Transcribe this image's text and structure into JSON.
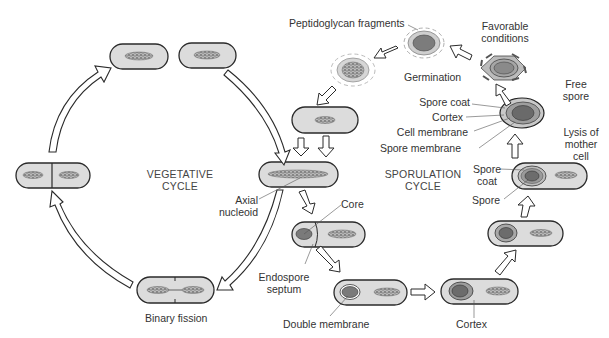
{
  "diagram": {
    "colors": {
      "cell_fill": "#dcdcdc",
      "cell_stroke": "#2a2a2a",
      "nucleoid": "#9a9a9a",
      "spore_core": "#7a7a7a",
      "arrow_fill": "#ffffff",
      "text": "#333333"
    },
    "cycles": {
      "vegetative": {
        "line1": "VEGETATIVE",
        "line2": "CYCLE"
      },
      "sporulation": {
        "line1": "SPORULATION",
        "line2": "CYCLE"
      }
    },
    "labels": {
      "peptidoglycan": "Peptidoglycan fragments",
      "favorable_1": "Favorable",
      "favorable_2": "conditions",
      "germination": "Germination",
      "free_1": "Free",
      "free_2": "spore",
      "spore_coat": "Spore coat",
      "cortex_top": "Cortex",
      "cell_membrane": "Cell membrane",
      "spore_membrane": "Spore membrane",
      "lysis_1": "Lysis of",
      "lysis_2": "mother",
      "lysis_3": "cell",
      "spore_coat2_1": "Spore",
      "spore_coat2_2": "coat",
      "spore": "Spore",
      "axial_1": "Axial",
      "axial_2": "nucleoid",
      "core": "Core",
      "endospore_1": "Endospore",
      "endospore_2": "septum",
      "double_membrane": "Double membrane",
      "cortex_bottom": "Cortex",
      "binary_fission": "Binary fission"
    },
    "stages": [
      "Vegetative cell (axial nucleoid)",
      "Endospore septum forms (core)",
      "Double membrane engulfment",
      "Cortex formation",
      "Spore coat formation",
      "Mature spore in mother cell",
      "Lysis of mother cell → free spore",
      "Favorable conditions → germination",
      "Vegetative cell",
      "Binary fission"
    ]
  }
}
